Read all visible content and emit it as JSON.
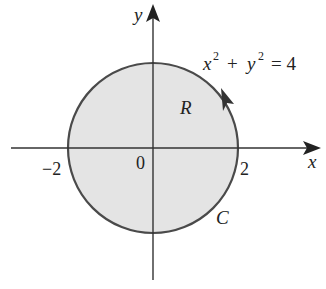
{
  "diagram": {
    "type": "region-in-plane",
    "colors": {
      "background": "#ffffff",
      "region_fill": "#e4e4e4",
      "curve_stroke": "#4a4a4a",
      "axis_stroke": "#333333",
      "text": "#222222"
    },
    "axes": {
      "x_label": "x",
      "y_label": "y",
      "origin_label": "0",
      "tick_labels": {
        "neg2": "−2",
        "pos2": "2"
      }
    },
    "curve": {
      "equation_lhs_x": "x",
      "equation_exp1": "2",
      "equation_plus": "+",
      "equation_y": "y",
      "equation_exp2": "2",
      "equation_rhs": "= 4",
      "curve_label": "C",
      "region_label": "R",
      "orientation": "counterclockwise",
      "radius": 2
    }
  }
}
